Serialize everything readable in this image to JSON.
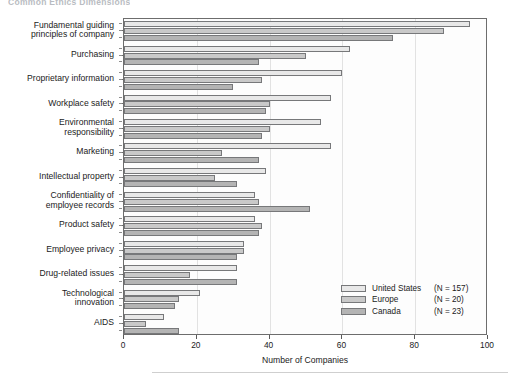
{
  "title": "Common Ethics Dimensions",
  "chart_data": {
    "type": "bar",
    "orientation": "horizontal",
    "title": "Common Ethics Dimensions",
    "xlabel": "Number of Companies",
    "ylabel": "",
    "xlim": [
      0,
      100
    ],
    "xticks": [
      0,
      20,
      40,
      60,
      80,
      100
    ],
    "grid": true,
    "legend_position": "bottom-right",
    "categories": [
      "Fundamental guiding principles of company",
      "Purchasing",
      "Proprietary information",
      "Workplace safety",
      "Environmental responsibility",
      "Marketing",
      "Intellectual property",
      "Confidentiality of employee records",
      "Product safety",
      "Employee privacy",
      "Drug-related issues",
      "Technological innovation",
      "AIDS"
    ],
    "series": [
      {
        "name": "United States",
        "n": 157,
        "color": "#e8e8e8",
        "values": [
          95,
          62,
          60,
          57,
          54,
          57,
          39,
          36,
          36,
          33,
          31,
          21,
          11
        ]
      },
      {
        "name": "Europe",
        "n": 20,
        "color": "#c9c9c9",
        "values": [
          88,
          50,
          38,
          40,
          40,
          27,
          25,
          37,
          38,
          33,
          18,
          15,
          6
        ]
      },
      {
        "name": "Canada",
        "n": 23,
        "color": "#b4b4b4",
        "values": [
          74,
          37,
          30,
          39,
          38,
          37,
          31,
          51,
          37,
          31,
          31,
          14,
          15
        ]
      }
    ]
  },
  "axis": {
    "x_title": "Number of Companies",
    "x_tick_labels": [
      "0",
      "20",
      "40",
      "60",
      "80",
      "100"
    ]
  },
  "legend": {
    "items": [
      {
        "label": "United States",
        "count": "(N = 157)",
        "key": "us"
      },
      {
        "label": "Europe",
        "count": "(N = 20)",
        "key": "eu"
      },
      {
        "label": "Canada",
        "count": "(N = 23)",
        "key": "ca"
      }
    ]
  }
}
